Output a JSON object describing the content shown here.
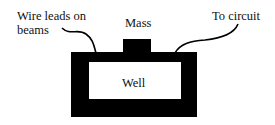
{
  "diagram": {
    "labels": {
      "wire_leads": [
        "Wire leads on",
        "beams"
      ],
      "mass": "Mass",
      "to_circuit": "To circuit",
      "well": "Well"
    },
    "colors": {
      "fill": "#000000",
      "background": "#ffffff",
      "text": "#111111"
    }
  }
}
